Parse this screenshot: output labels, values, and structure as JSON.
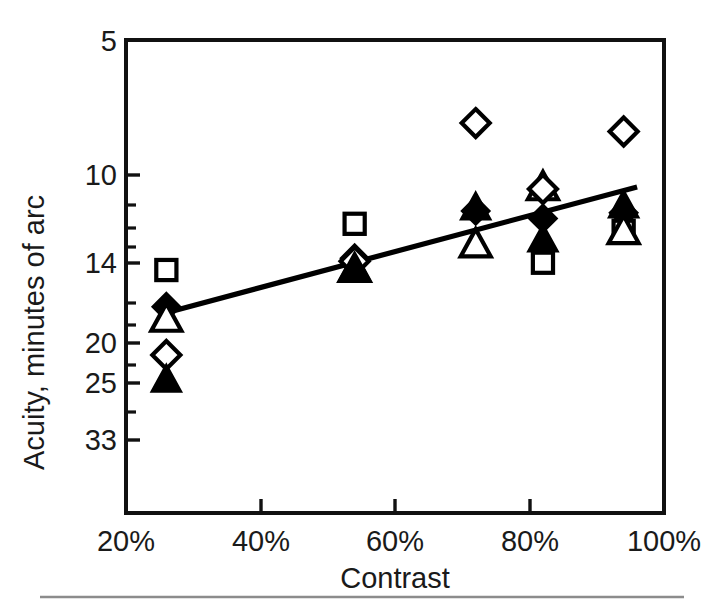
{
  "figure": {
    "background": "#ffffff",
    "ink_color": "#000000",
    "footer_rule_color": "#8c8c8c"
  },
  "chart_data": {
    "type": "scatter",
    "title": "",
    "xlabel": "Contrast",
    "ylabel": "Acuity, minutes of arc",
    "x_tick_labels": [
      "20%",
      "40%",
      "60%",
      "80%",
      "100%"
    ],
    "x_tick_values": [
      20,
      40,
      60,
      80,
      100
    ],
    "xlim": [
      20,
      100
    ],
    "y_tick_labels": [
      "5",
      "10",
      "14",
      "20",
      "25",
      "33"
    ],
    "y_tick_values": [
      5,
      10,
      14,
      20,
      25,
      33
    ],
    "y_minor_tick_values": [
      11,
      12,
      13,
      16,
      18,
      22,
      28,
      30
    ],
    "ylim": [
      5,
      45
    ],
    "y_scale": "log-inverted",
    "grid": false,
    "legend": "none",
    "series": [
      {
        "name": "open-square",
        "marker": "open-square",
        "points": [
          {
            "x": 26,
            "y": 14.8
          },
          {
            "x": 54,
            "y": 11.9
          },
          {
            "x": 82,
            "y": 14.3
          },
          {
            "x": 94,
            "y": 12.3
          }
        ]
      },
      {
        "name": "filled-diamond",
        "marker": "filled-diamond",
        "points": [
          {
            "x": 26,
            "y": 17.6
          },
          {
            "x": 54,
            "y": 14.0
          },
          {
            "x": 72,
            "y": 11.2
          },
          {
            "x": 82,
            "y": 11.6
          },
          {
            "x": 94,
            "y": 11.3
          }
        ]
      },
      {
        "name": "open-triangle",
        "marker": "open-triangle",
        "points": [
          {
            "x": 26,
            "y": 18.6
          },
          {
            "x": 54,
            "y": 14.7
          },
          {
            "x": 72,
            "y": 13.1
          },
          {
            "x": 82,
            "y": 10.0
          },
          {
            "x": 94,
            "y": 12.3
          }
        ]
      },
      {
        "name": "open-diamond",
        "marker": "open-diamond",
        "points": [
          {
            "x": 26,
            "y": 22.1
          },
          {
            "x": 54,
            "y": 14.2
          },
          {
            "x": 72,
            "y": 7.4
          },
          {
            "x": 82,
            "y": 10.1
          },
          {
            "x": 94,
            "y": 7.7
          }
        ]
      },
      {
        "name": "filled-triangle",
        "marker": "filled-triangle",
        "points": [
          {
            "x": 26,
            "y": 24.8
          },
          {
            "x": 54,
            "y": 14.6
          },
          {
            "x": 72,
            "y": 11.0
          },
          {
            "x": 82,
            "y": 12.8
          },
          {
            "x": 94,
            "y": 10.9
          }
        ]
      }
    ],
    "trend_line": {
      "name": "regression-line",
      "from": {
        "x": 26,
        "y": 18.1
      },
      "to": {
        "x": 96,
        "y": 10.0
      }
    },
    "annotations": []
  }
}
